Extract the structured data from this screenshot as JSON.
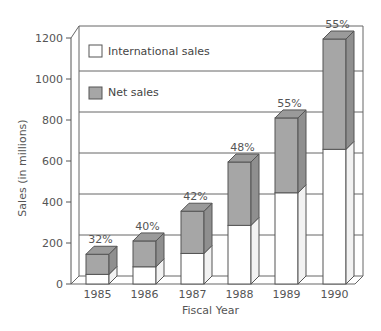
{
  "chart_data": {
    "type": "bar",
    "stacked": true,
    "style": "3d",
    "title": "",
    "xlabel": "Fiscal Year",
    "ylabel": "Sales (in millions)",
    "ylim": [
      0,
      1200
    ],
    "yticks": [
      0,
      200,
      400,
      600,
      800,
      1000,
      1200
    ],
    "grid": true,
    "legend_position": "top-left inside",
    "categories": [
      "1985",
      "1986",
      "1987",
      "1988",
      "1989",
      "1990"
    ],
    "series": [
      {
        "name": "International sales",
        "color": "#ffffff",
        "values": [
          47,
          84,
          149,
          286,
          445,
          657
        ]
      },
      {
        "name": "Net sales",
        "color": "#a6a6a6",
        "values": [
          145,
          210,
          355,
          595,
          810,
          1195
        ],
        "note": "total bar height"
      }
    ],
    "annotations": [
      "32%",
      "40%",
      "42%",
      "48%",
      "55%",
      "55%"
    ],
    "annotation_meaning": "International sales as percentage of net sales"
  },
  "legend": {
    "items": [
      {
        "label": "International sales",
        "swatch": "#ffffff"
      },
      {
        "label": "Net sales",
        "swatch": "#a6a6a6"
      }
    ]
  },
  "axes": {
    "x_title": "Fiscal Year",
    "y_title": "Sales (in millions)"
  },
  "colors": {
    "net_front": "#a6a6a6",
    "net_side": "#8f8f8f",
    "net_top": "#9a9a9a",
    "intl_front": "#ffffff",
    "intl_side": "#f2f2f2",
    "line": "#555555"
  }
}
